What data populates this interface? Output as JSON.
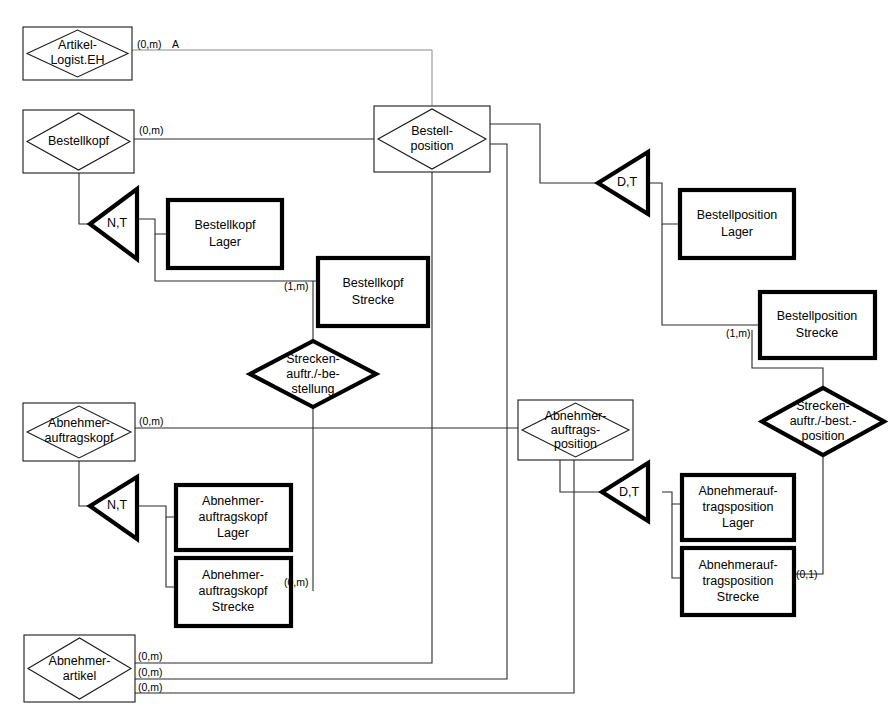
{
  "diagram": {
    "notation": "Entity-Relationship / Spezialisierung",
    "colors": {
      "background": "#ffffff",
      "line": "#2b2b2b",
      "faint_line": "#8a8a8a",
      "thick_border": "#000000",
      "text": "#000000"
    }
  },
  "entities": [
    {
      "id": "artikel-logist-eh",
      "name": "artikel-logist-eh",
      "line1": "Artikel-",
      "line2": "Logist.EH",
      "line3": "",
      "style": "thin-diamond-in-box"
    },
    {
      "id": "bestellkopf",
      "name": "bestellkopf",
      "line1": "Bestellkopf",
      "line2": "",
      "line3": "",
      "style": "thin-diamond-in-box"
    },
    {
      "id": "bestellposition",
      "name": "bestellposition",
      "line1": "Bestell-",
      "line2": "position",
      "line3": "",
      "style": "thin-diamond-in-box"
    },
    {
      "id": "abnehmer-auftragskopf",
      "name": "abnehmer-auftragskopf",
      "line1": "Abnehmer-",
      "line2": "auftragskopf",
      "line3": "",
      "style": "thin-diamond-in-box"
    },
    {
      "id": "abnehmer-auftragsposition",
      "name": "abnehmer-auftragsposition",
      "line1": "Abnehmer-",
      "line2": "auftrags-",
      "line3": "position",
      "style": "thin-diamond-in-box"
    },
    {
      "id": "abnehmerartikel",
      "name": "abnehmerartikel",
      "line1": "Abnehmer-",
      "line2": "artikel",
      "line3": "",
      "style": "thin-diamond-in-box"
    }
  ],
  "subtype_boxes": [
    {
      "id": "bestellkopf-lager",
      "line1": "Bestellkopf",
      "line2": "Lager",
      "line3": ""
    },
    {
      "id": "bestellkopf-strecke",
      "line1": "Bestellkopf",
      "line2": "Strecke",
      "line3": ""
    },
    {
      "id": "bestellposition-lager",
      "line1": "Bestellposition",
      "line2": "Lager",
      "line3": ""
    },
    {
      "id": "bestellposition-strecke",
      "line1": "Bestellposition",
      "line2": "Strecke",
      "line3": ""
    },
    {
      "id": "abnehmer-auftragskopf-lager",
      "line1": "Abnehmer-",
      "line2": "auftragskopf",
      "line3": "Lager"
    },
    {
      "id": "abnehmer-auftragskopf-strecke",
      "line1": "Abnehmer-",
      "line2": "auftragskopf",
      "line3": "Strecke"
    },
    {
      "id": "abnehmerauftragsposition-lager",
      "line1": "Abnehmerauf-",
      "line2": "tragsposition",
      "line3": "Lager"
    },
    {
      "id": "abnehmerauftragsposition-strecke",
      "line1": "Abnehmerauf-",
      "line2": "tragsposition",
      "line3": "Strecke"
    }
  ],
  "relationships": [
    {
      "id": "streckenauftrag-bestellung",
      "line1": "Strecken-",
      "line2": "auftr./-be-",
      "line3": "stellung"
    },
    {
      "id": "streckenauftrag-bestposition",
      "line1": "Strecken-",
      "line2": "auftr./-best.-",
      "line3": "position"
    }
  ],
  "specialization_triangles": [
    {
      "id": "tri-bestellkopf",
      "label": "N,T"
    },
    {
      "id": "tri-bestellposition",
      "label": "D,T"
    },
    {
      "id": "tri-abnehmer-auftragskopf",
      "label": "N,T"
    },
    {
      "id": "tri-abnehmer-auftragsposition",
      "label": "D,T"
    }
  ],
  "cardinalities": [
    {
      "id": "card-artikel-logist",
      "text": "(0,m)"
    },
    {
      "id": "card-artikel-role-a",
      "text": "A"
    },
    {
      "id": "card-bestellkopf",
      "text": "(0,m)"
    },
    {
      "id": "card-bestellkopf-strecke",
      "text": "(1,m)"
    },
    {
      "id": "card-bestellposition-strecke",
      "text": "(1,m)"
    },
    {
      "id": "card-abnehmer-auftragskopf",
      "text": "(0,m)"
    },
    {
      "id": "card-abnehmer-auftragskopf-strecke",
      "text": "(0,m)"
    },
    {
      "id": "card-abnehmerauftragsposition-strecke",
      "text": "(0,1)"
    },
    {
      "id": "card-abnehmerartikel-1",
      "text": "(0,m)"
    },
    {
      "id": "card-abnehmerartikel-2",
      "text": "(0,m)"
    },
    {
      "id": "card-abnehmerartikel-3",
      "text": "(0,m)"
    }
  ]
}
